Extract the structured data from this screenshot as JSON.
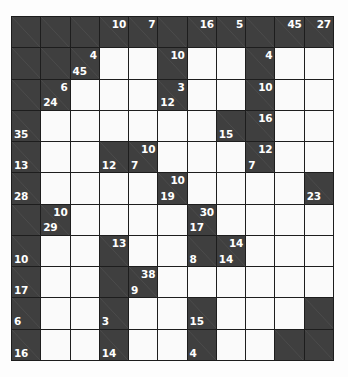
{
  "puzzle": {
    "type": "kakuro-grid",
    "rows": 12,
    "cols": 11,
    "colors": {
      "block": "#3f3f3f",
      "open": "#fafafa",
      "grid_line": "#1d1d1d",
      "clue_text": "#ffffff",
      "slash": "#5d5d5d",
      "page_background": "#fdfdfd"
    },
    "cells": [
      [
        {
          "t": "block"
        },
        {
          "t": "block"
        },
        {
          "t": "block"
        },
        {
          "t": "block",
          "down": "10"
        },
        {
          "t": "block",
          "down": "7"
        },
        {
          "t": "block"
        },
        {
          "t": "block",
          "down": "16"
        },
        {
          "t": "block",
          "down": "5"
        },
        {
          "t": "block"
        },
        {
          "t": "block",
          "down": "45"
        },
        {
          "t": "block",
          "down": "27"
        }
      ],
      [
        {
          "t": "block"
        },
        {
          "t": "block"
        },
        {
          "t": "block",
          "down": "4",
          "across": "45"
        },
        {
          "t": "open"
        },
        {
          "t": "open"
        },
        {
          "t": "block",
          "down": "10"
        },
        {
          "t": "open"
        },
        {
          "t": "open"
        },
        {
          "t": "block",
          "down": "4"
        },
        {
          "t": "open"
        },
        {
          "t": "open"
        }
      ],
      [
        {
          "t": "block"
        },
        {
          "t": "block",
          "down": "6",
          "across": "24"
        },
        {
          "t": "open"
        },
        {
          "t": "open"
        },
        {
          "t": "open"
        },
        {
          "t": "block",
          "down": "3",
          "across": "12"
        },
        {
          "t": "open"
        },
        {
          "t": "open"
        },
        {
          "t": "block",
          "down": "10"
        },
        {
          "t": "open"
        },
        {
          "t": "open"
        }
      ],
      [
        {
          "t": "block",
          "across": "35"
        },
        {
          "t": "open"
        },
        {
          "t": "open"
        },
        {
          "t": "open"
        },
        {
          "t": "open"
        },
        {
          "t": "open"
        },
        {
          "t": "open"
        },
        {
          "t": "block",
          "across": "15"
        },
        {
          "t": "block",
          "down": "16"
        },
        {
          "t": "open"
        },
        {
          "t": "open"
        }
      ],
      [
        {
          "t": "block",
          "across": "13"
        },
        {
          "t": "open"
        },
        {
          "t": "open"
        },
        {
          "t": "block",
          "across": "12"
        },
        {
          "t": "block",
          "down": "10",
          "across": "7"
        },
        {
          "t": "open"
        },
        {
          "t": "open"
        },
        {
          "t": "open"
        },
        {
          "t": "block",
          "down": "12",
          "across": "7"
        },
        {
          "t": "open"
        },
        {
          "t": "open"
        }
      ],
      [
        {
          "t": "block",
          "across": "28"
        },
        {
          "t": "open"
        },
        {
          "t": "open"
        },
        {
          "t": "open"
        },
        {
          "t": "open"
        },
        {
          "t": "block",
          "down": "10",
          "across": "19"
        },
        {
          "t": "open"
        },
        {
          "t": "open"
        },
        {
          "t": "open"
        },
        {
          "t": "open"
        },
        {
          "t": "block",
          "across": "23"
        }
      ],
      [
        {
          "t": "block"
        },
        {
          "t": "block",
          "down": "10",
          "across": "29"
        },
        {
          "t": "open"
        },
        {
          "t": "open"
        },
        {
          "t": "open"
        },
        {
          "t": "open"
        },
        {
          "t": "block",
          "down": "30",
          "across": "17"
        },
        {
          "t": "open"
        },
        {
          "t": "open"
        },
        {
          "t": "open"
        },
        {
          "t": "open"
        }
      ],
      [
        {
          "t": "block",
          "across": "10"
        },
        {
          "t": "open"
        },
        {
          "t": "open"
        },
        {
          "t": "block",
          "down": "13"
        },
        {
          "t": "open"
        },
        {
          "t": "open"
        },
        {
          "t": "block",
          "across": "8"
        },
        {
          "t": "block",
          "down": "14",
          "across": "14"
        },
        {
          "t": "open"
        },
        {
          "t": "open"
        },
        {
          "t": "open"
        }
      ],
      [
        {
          "t": "block",
          "across": "17"
        },
        {
          "t": "open"
        },
        {
          "t": "open"
        },
        {
          "t": "block"
        },
        {
          "t": "block",
          "down": "38",
          "across": "9"
        },
        {
          "t": "open"
        },
        {
          "t": "open"
        },
        {
          "t": "open"
        },
        {
          "t": "open"
        },
        {
          "t": "open"
        },
        {
          "t": "open"
        }
      ],
      [
        {
          "t": "block",
          "across": "6"
        },
        {
          "t": "open"
        },
        {
          "t": "open"
        },
        {
          "t": "block",
          "across": "3"
        },
        {
          "t": "open"
        },
        {
          "t": "open"
        },
        {
          "t": "block",
          "across": "15"
        },
        {
          "t": "open"
        },
        {
          "t": "open"
        },
        {
          "t": "open"
        },
        {
          "t": "block"
        }
      ],
      [
        {
          "t": "block",
          "across": "16"
        },
        {
          "t": "open"
        },
        {
          "t": "open"
        },
        {
          "t": "block",
          "across": "14"
        },
        {
          "t": "open"
        },
        {
          "t": "open"
        },
        {
          "t": "block",
          "across": "4"
        },
        {
          "t": "open"
        },
        {
          "t": "open"
        },
        {
          "t": "block"
        },
        {
          "t": "block"
        }
      ]
    ]
  }
}
